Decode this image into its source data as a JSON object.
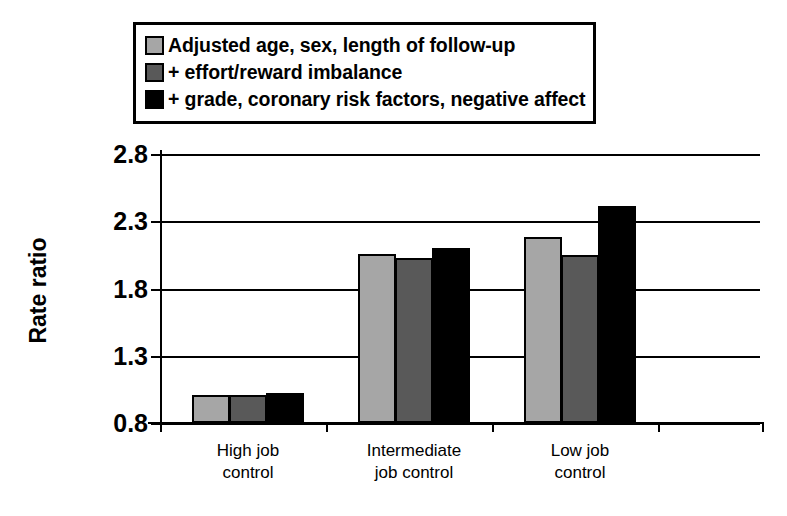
{
  "chart_data": {
    "type": "bar",
    "title": "",
    "xlabel": "",
    "ylabel": "Rate ratio",
    "ylim": [
      0.8,
      2.8
    ],
    "yticks": [
      "0.8",
      "1.3",
      "1.8",
      "2.3",
      "2.8"
    ],
    "ytick_values": [
      0.8,
      1.3,
      1.8,
      2.3,
      2.8
    ],
    "grid": true,
    "legend_position": "top",
    "categories": [
      "High job\ncontrol",
      "Intermediate\njob control",
      "Low job\ncontrol"
    ],
    "category_labels": [
      {
        "line1": "High job",
        "line2": "control"
      },
      {
        "line1": "Intermediate",
        "line2": "job control"
      },
      {
        "line1": "Low job",
        "line2": "control"
      }
    ],
    "series": [
      {
        "name": "Adjusted age, sex, length of follow-up",
        "color": "#a6a6a6",
        "values": [
          1.01,
          2.06,
          2.18
        ]
      },
      {
        "name": "+ effort/reward imbalance",
        "color": "#595959",
        "values": [
          1.01,
          2.03,
          2.05
        ]
      },
      {
        "name": "+ grade, coronary risk factors, negative affect",
        "color": "#000000",
        "values": [
          1.02,
          2.1,
          2.41
        ]
      }
    ]
  },
  "legend": {
    "items": [
      {
        "label": "Adjusted age, sex, length of follow-up",
        "color": "#a6a6a6"
      },
      {
        "label": "+ effort/reward imbalance",
        "color": "#595959"
      },
      {
        "label": "+ grade, coronary risk factors, negative affect",
        "color": "#000000"
      }
    ]
  },
  "axis": {
    "y_title": "Rate ratio"
  }
}
